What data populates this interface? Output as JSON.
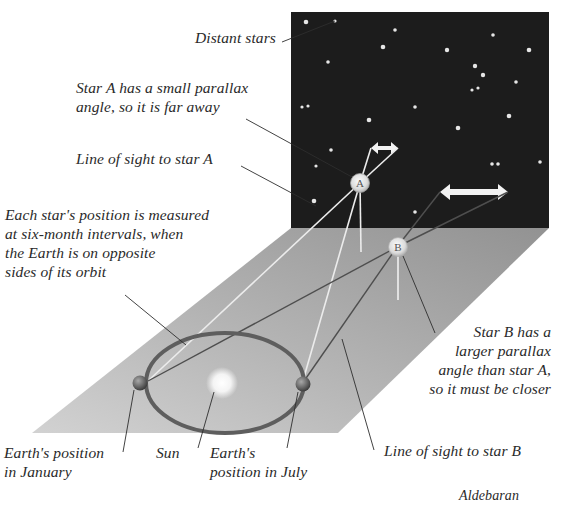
{
  "diagram": {
    "labels": {
      "distant_stars": "Distant stars",
      "star_a_small_parallax": [
        "Star A has a small parallax",
        "angle, so it is far away"
      ],
      "line_of_sight_a": "Line of sight to star A",
      "measured_six_months": [
        "Each star's position is measured",
        "at six-month intervals, when",
        "the Earth is on opposite",
        "sides of its orbit"
      ],
      "star_b_larger_parallax": [
        "Star B has a",
        "larger parallax",
        "angle than star A,",
        "so it must be closer"
      ],
      "earth_january": [
        "Earth's position",
        "in January"
      ],
      "sun": "Sun",
      "earth_july": [
        "Earth's",
        "position in July"
      ],
      "line_of_sight_b": "Line of sight to star B",
      "credit": "Aldebaran"
    },
    "stars": {
      "a": {
        "letter": "A"
      },
      "b": {
        "letter": "B"
      }
    },
    "colors": {
      "sky": "#1c1c1c",
      "plane_light": "#c9c9c9",
      "plane_dark": "#8f8f8f",
      "orbit": "#5e5e5e",
      "sight_line_a": "#e8e8e8",
      "sight_line_b": "#555555",
      "leader_line": "#333333",
      "text": "#2a2a2a"
    }
  }
}
